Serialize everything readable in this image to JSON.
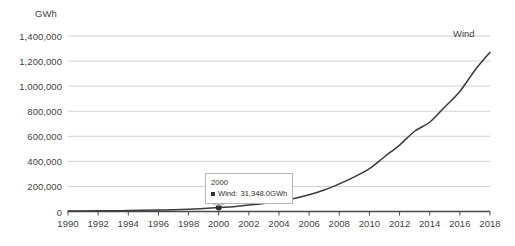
{
  "chart_data": {
    "type": "line",
    "title": "",
    "xlabel": "",
    "ylabel": "GWh",
    "ylim": [
      0,
      1400000
    ],
    "xlim": [
      1990,
      2018
    ],
    "grid": true,
    "legend_position": "inline-right",
    "y_ticks": [
      "0",
      "200,000",
      "400,000",
      "600,000",
      "800,000",
      "1,000,000",
      "1,200,000",
      "1,400,000"
    ],
    "y_tick_values": [
      0,
      200000,
      400000,
      600000,
      800000,
      1000000,
      1200000,
      1400000
    ],
    "x_ticks": [
      "1990",
      "1992",
      "1994",
      "1996",
      "1998",
      "2000",
      "2002",
      "2004",
      "2006",
      "2008",
      "2010",
      "2012",
      "2014",
      "2016",
      "2018"
    ],
    "x_tick_values": [
      1990,
      1992,
      1994,
      1996,
      1998,
      2000,
      2002,
      2004,
      2006,
      2008,
      2010,
      2012,
      2014,
      2016,
      2018
    ],
    "series": [
      {
        "name": "Wind",
        "color": "#3a3a3a",
        "x": [
          1990,
          1991,
          1992,
          1993,
          1994,
          1995,
          1996,
          1997,
          1998,
          1999,
          2000,
          2001,
          2002,
          2003,
          2004,
          2005,
          2006,
          2007,
          2008,
          2009,
          2010,
          2011,
          2012,
          2013,
          2014,
          2015,
          2016,
          2017,
          2018
        ],
        "values": [
          3880,
          4580,
          5400,
          6400,
          7600,
          9200,
          11200,
          14000,
          18500,
          24000,
          31348,
          38500,
          52000,
          63000,
          85000,
          104000,
          133000,
          171000,
          220000,
          276000,
          342000,
          437000,
          530000,
          640000,
          712000,
          834000,
          958000,
          1127000,
          1270000
        ]
      }
    ],
    "annotations": [
      {
        "type": "tooltip",
        "x_label": "2000",
        "series_label": "Wind:",
        "value_label": "31,348.0GWh",
        "point_x": 2000,
        "point_y": 31348
      }
    ],
    "series_inline_label": "Wind",
    "axis_color": "#4a4a4a",
    "grid_color": "#d0d0d0",
    "text_color": "#3f3f3f",
    "background": "#ffffff"
  }
}
